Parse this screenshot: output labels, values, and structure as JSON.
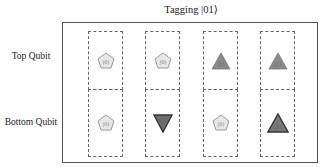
{
  "title": "Tagging |01⟩",
  "rows": [
    {
      "label": "Top Qubit"
    },
    {
      "label": "Bottom Qubit"
    }
  ],
  "colors": {
    "pentagon_fill": "#e8e8e8",
    "pentagon_stroke": "#999999",
    "triangle_fill": "#8a8a8a",
    "triangle_stroke": "#666666",
    "triangle_down_fill": "#6e6e6e",
    "triangle_dark_stroke": "#333333"
  },
  "grid": {
    "columns": 4,
    "top": [
      {
        "shape": "pentagon",
        "label": "|0⟩"
      },
      {
        "shape": "pentagon",
        "label": "|0⟩"
      },
      {
        "shape": "triangle-up",
        "label": "|1⟩"
      },
      {
        "shape": "triangle-up",
        "label": "|1⟩"
      }
    ],
    "bottom": [
      {
        "shape": "pentagon",
        "label": "|0⟩"
      },
      {
        "shape": "triangle-down",
        "label": "|1⟩"
      },
      {
        "shape": "pentagon",
        "label": "|0⟩"
      },
      {
        "shape": "triangle-up",
        "label": "|1⟩"
      }
    ]
  }
}
